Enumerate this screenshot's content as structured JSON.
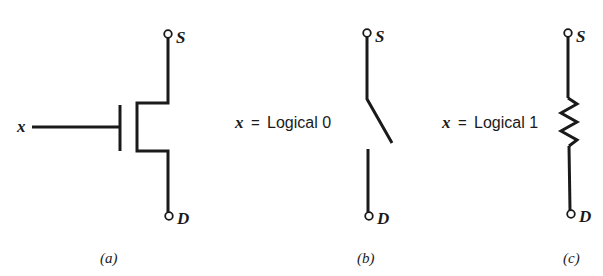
{
  "figure": {
    "panels": [
      {
        "id": "a",
        "caption": "(a)",
        "component": "MOSFET transistor symbol",
        "gate_label": "x",
        "top_terminal_label": "S",
        "bottom_terminal_label": "D"
      },
      {
        "id": "b",
        "caption": "(b)",
        "component": "open switch",
        "condition_var": "x",
        "condition_eq": "=",
        "condition_text": "Logical 0",
        "top_terminal_label": "S",
        "bottom_terminal_label": "D"
      },
      {
        "id": "c",
        "caption": "(c)",
        "component": "resistor",
        "condition_var": "x",
        "condition_eq": "=",
        "condition_text": "Logical 1",
        "top_terminal_label": "S",
        "bottom_terminal_label": "D"
      }
    ],
    "colors": {
      "ink": "#1a1a1a",
      "background": "#ffffff"
    }
  }
}
